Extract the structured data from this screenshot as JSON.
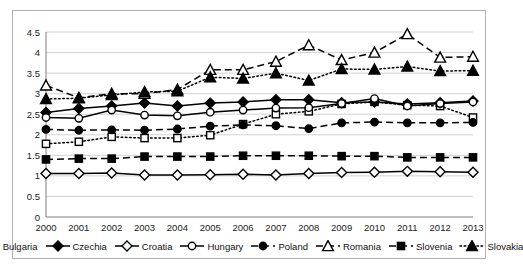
{
  "chart_data": {
    "type": "line",
    "title": "",
    "subtitle": "",
    "xlabel": "",
    "ylabel": "",
    "x": [
      2000,
      2001,
      2002,
      2003,
      2004,
      2005,
      2006,
      2007,
      2008,
      2009,
      2010,
      2011,
      2012,
      2013
    ],
    "xtick_labels": [
      "2000",
      "2001",
      "2002",
      "2003",
      "2004",
      "2005",
      "2006",
      "2007",
      "2008",
      "2009",
      "2010",
      "2011",
      "2012",
      "2013"
    ],
    "ytick_labels": [
      "0",
      "0.5",
      "1",
      "1.5",
      "2",
      "2.5",
      "3",
      "3.5",
      "4",
      "4.5"
    ],
    "ytick_values": [
      0,
      0.5,
      1,
      1.5,
      2,
      2.5,
      3,
      3.5,
      4,
      4.5
    ],
    "ylim": [
      0,
      4.5
    ],
    "grid": "horizontal",
    "legend_position": "bottom",
    "series": [
      {
        "name": "Bulgaria",
        "marker": "open-square",
        "line": "dotted",
        "color": "#000000",
        "values": [
          1.78,
          1.83,
          1.95,
          1.92,
          1.92,
          1.99,
          2.26,
          2.5,
          2.57,
          2.75,
          2.8,
          2.72,
          2.7,
          2.42
        ]
      },
      {
        "name": "Czechia",
        "marker": "filled-diamond",
        "line": "solid",
        "color": "#000000",
        "values": [
          2.54,
          2.64,
          2.7,
          2.77,
          2.7,
          2.77,
          2.8,
          2.85,
          2.85,
          2.78,
          2.8,
          2.75,
          2.78,
          2.82
        ]
      },
      {
        "name": "Croatia",
        "marker": "open-diamond",
        "line": "solid",
        "color": "#000000",
        "values": [
          1.06,
          1.06,
          1.07,
          1.02,
          1.02,
          1.03,
          1.04,
          1.02,
          1.06,
          1.08,
          1.09,
          1.11,
          1.1,
          1.09
        ]
      },
      {
        "name": "Hungary",
        "marker": "open-circle",
        "line": "solid",
        "color": "#000000",
        "values": [
          2.42,
          2.4,
          2.6,
          2.48,
          2.46,
          2.55,
          2.6,
          2.65,
          2.66,
          2.76,
          2.88,
          2.7,
          2.76,
          2.8
        ]
      },
      {
        "name": "Poland",
        "marker": "filled-circle",
        "line": "dashed",
        "color": "#000000",
        "values": [
          2.13,
          2.11,
          2.12,
          2.11,
          2.14,
          2.21,
          2.24,
          2.22,
          2.15,
          2.29,
          2.31,
          2.29,
          2.29,
          2.3
        ]
      },
      {
        "name": "Romania",
        "marker": "open-triangle",
        "line": "dashed",
        "color": "#000000",
        "values": [
          3.2,
          2.9,
          3.0,
          3.0,
          3.1,
          3.58,
          3.58,
          3.78,
          4.18,
          3.82,
          4.0,
          4.45,
          3.88,
          3.9
        ]
      },
      {
        "name": "Slovenia",
        "marker": "filled-square",
        "line": "dashed",
        "color": "#000000",
        "values": [
          1.4,
          1.42,
          1.42,
          1.47,
          1.47,
          1.47,
          1.49,
          1.49,
          1.49,
          1.48,
          1.48,
          1.45,
          1.45,
          1.45
        ]
      },
      {
        "name": "Slovakia",
        "marker": "filled-triangle",
        "line": "dotted",
        "color": "#000000",
        "values": [
          2.87,
          2.89,
          2.97,
          3.04,
          3.06,
          3.4,
          3.37,
          3.5,
          3.32,
          3.6,
          3.59,
          3.66,
          3.55,
          3.56
        ]
      }
    ]
  },
  "legend": {
    "items": [
      {
        "label": "Bulgaria"
      },
      {
        "label": "Czechia"
      },
      {
        "label": "Croatia"
      },
      {
        "label": "Hungary"
      },
      {
        "label": "Poland"
      },
      {
        "label": "Romania"
      },
      {
        "label": "Slovenia"
      },
      {
        "label": "Slovakia"
      }
    ]
  }
}
